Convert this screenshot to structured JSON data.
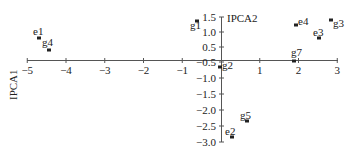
{
  "chart_data": {
    "type": "scatter",
    "title": "",
    "xlabel": "IPCA1",
    "ylabel": "IPCA2",
    "xlim": [
      -5,
      3
    ],
    "ylim": [
      -3.0,
      1.5
    ],
    "grid": false,
    "legend": null,
    "x_ticks": [
      "-5",
      "-4",
      "-3",
      "-2",
      "-1",
      "1",
      "2",
      "3"
    ],
    "y_ticks": [
      "1.5",
      "1.0",
      "0.5",
      "-0.5",
      "-1.0",
      "-1.5",
      "-2.0",
      "-2.5",
      "-3.0"
    ],
    "points": [
      {
        "label": "e1",
        "x": -4.7,
        "y": 0.8
      },
      {
        "label": "g4",
        "x": -4.45,
        "y": 0.4
      },
      {
        "label": "g1",
        "x": -0.6,
        "y": 1.35
      },
      {
        "label": "g2",
        "x": -0.02,
        "y": -0.25
      },
      {
        "label": "e2",
        "x": 0.28,
        "y": -2.7
      },
      {
        "label": "g5",
        "x": 0.68,
        "y": -2.2
      },
      {
        "label": "e4",
        "x": 1.95,
        "y": 1.2
      },
      {
        "label": "g3",
        "x": 2.85,
        "y": 1.35
      },
      {
        "label": "e3",
        "x": 2.55,
        "y": 0.75
      },
      {
        "label": "g7",
        "x": 1.9,
        "y": -0.05
      }
    ]
  },
  "axes": {
    "x_axis_label": "IPCA1",
    "y_axis_label": "IPCA2"
  }
}
